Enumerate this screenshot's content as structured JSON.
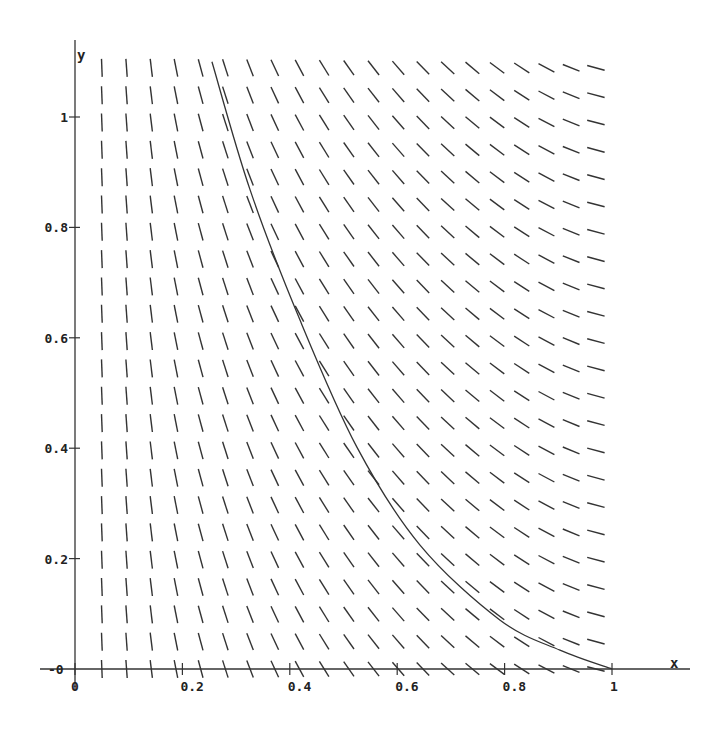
{
  "chart_data": {
    "type": "line",
    "subtype": "slope_field_with_solution_curve",
    "title": "",
    "xlabel": "x",
    "ylabel": "y",
    "xlim": [
      0,
      1.1
    ],
    "ylim": [
      -0.02,
      1.12
    ],
    "grid": false,
    "legend": null,
    "x_ticks": [
      {
        "value": 0,
        "label": "0"
      },
      {
        "value": 0.2,
        "label": "0.2"
      },
      {
        "value": 0.4,
        "label": "0.4"
      },
      {
        "value": 0.6,
        "label": "0.6"
      },
      {
        "value": 0.8,
        "label": "0.8"
      },
      {
        "value": 1,
        "label": "1"
      }
    ],
    "y_ticks": [
      {
        "value": 0,
        "label": "0"
      },
      {
        "value": 0.2,
        "label": "0.2"
      },
      {
        "value": 0.4,
        "label": "0.4"
      },
      {
        "value": 0.6,
        "label": "0.6"
      },
      {
        "value": 0.8,
        "label": "0.8"
      },
      {
        "value": 1,
        "label": "1"
      }
    ],
    "slope_field": {
      "x_start": 0.05,
      "x_step": 0.046,
      "columns": 21,
      "y_start": 0.0,
      "y_step": 0.0495,
      "rows": 23,
      "segment_length_px": 18,
      "angle_deg_by_column": [
        88,
        86,
        83,
        79,
        75,
        72,
        69,
        65,
        62,
        58,
        55,
        52,
        49,
        46,
        43,
        40,
        37,
        33,
        28,
        22,
        15
      ],
      "note": "slope depends only on x; all segments slope downward"
    },
    "series": [
      {
        "name": "solution curve",
        "x": [
          0.255,
          0.326,
          0.419,
          0.525,
          0.642,
          0.791,
          0.903,
          1.0
        ],
        "y": [
          1.1,
          0.868,
          0.632,
          0.402,
          0.225,
          0.089,
          0.034,
          0.0
        ]
      }
    ]
  },
  "axes": {
    "x_name": "x",
    "y_name": "y",
    "origin_x_label": "0",
    "origin_y_label": "-0"
  }
}
